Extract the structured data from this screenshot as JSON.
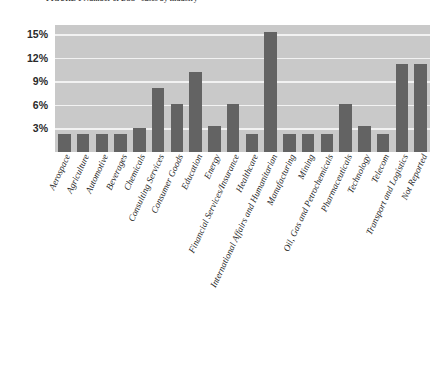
{
  "chart_data": {
    "type": "bar",
    "title": "FIGURE 1 Number of DSS* cases by industry",
    "xlabel": "",
    "ylabel": "",
    "ylim": [
      0,
      16.2
    ],
    "grid": true,
    "legend": "none",
    "yticks": [
      3,
      6,
      9,
      12,
      15
    ],
    "ytick_labels": [
      "3%",
      "6%",
      "9%",
      "12%",
      "15%"
    ],
    "categories": [
      "Aerospace",
      "Agriculture",
      "Automotive",
      "Beverages",
      "Chemicals",
      "Consulting Services",
      "Consumer Goods",
      "Education",
      "Energy",
      "Financial Services/Insurance",
      "Healthcare",
      "International Affairs and Humanitarian",
      "Manufacturing",
      "Mining",
      "Oil, Gas and Petrochemicals",
      "Pharmaceuticals",
      "Technology",
      "Telecom",
      "Transport and Logistics",
      "Not Reported"
    ],
    "values": [
      2.3,
      2.3,
      2.3,
      2.3,
      3.0,
      8.2,
      6.1,
      10.2,
      3.3,
      6.1,
      2.3,
      15.3,
      2.3,
      2.3,
      2.3,
      6.1,
      3.3,
      2.3,
      11.2,
      11.2
    ],
    "value_labels": [
      "2.3%",
      "2.3%",
      "2.3%",
      "2.3%",
      "3.0%",
      "8.2%",
      "6.1%",
      "10.2%",
      "3.3%",
      "6.1%",
      "2.3%",
      "15.3%",
      "2.3%",
      "2.3%",
      "2.3%",
      "6.1%",
      "3.3%",
      "2.3%",
      "11.2%",
      "11.2%"
    ],
    "colors": {
      "bar": "#636363",
      "plot_background": "#c9c9c9",
      "gridline": "#f2f2f2",
      "page_background": "#ffffff",
      "tick_text": "#1f1f1f"
    }
  }
}
